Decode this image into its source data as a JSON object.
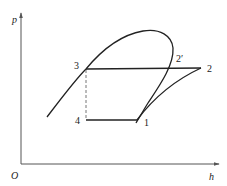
{
  "diagram": {
    "axes": {
      "y_label": "p",
      "x_label": "h",
      "origin_label": "O"
    },
    "points": [
      {
        "id": "1",
        "label": "1"
      },
      {
        "id": "2",
        "label": "2"
      },
      {
        "id": "2p",
        "label": "2′"
      },
      {
        "id": "3",
        "label": "3"
      },
      {
        "id": "4",
        "label": "4"
      }
    ],
    "colors": {
      "line": "#222222",
      "axis": "#555555",
      "dashed": "#777777",
      "background": "#ffffff"
    }
  }
}
